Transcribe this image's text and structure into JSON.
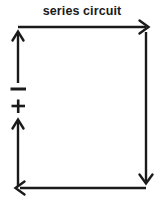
{
  "figure": {
    "kind": "circuit-schematic",
    "title": "series circuit",
    "width": 164,
    "height": 205,
    "background_color": "#ffffff",
    "stroke_color": "#1a1a1a",
    "stroke_width": 2.2
  },
  "labels": {
    "battery_negative": "−",
    "battery_positive": "+"
  },
  "elements": [
    {
      "name": "top-wire",
      "type": "arrow",
      "direction": "right",
      "from": [
        18,
        27
      ],
      "to": [
        147,
        27
      ]
    },
    {
      "name": "right-wire",
      "type": "arrow",
      "direction": "down",
      "from": [
        146,
        30
      ],
      "to": [
        146,
        186
      ]
    },
    {
      "name": "bottom-wire",
      "type": "arrow",
      "direction": "left",
      "from": [
        146,
        188
      ],
      "to": [
        18,
        188
      ]
    },
    {
      "name": "upper-left-wire",
      "type": "arrow",
      "direction": "up",
      "from": [
        18,
        83
      ],
      "to": [
        18,
        30
      ]
    },
    {
      "name": "lower-left-wire",
      "type": "arrow",
      "direction": "up",
      "from": [
        18,
        187
      ],
      "to": [
        18,
        118
      ]
    },
    {
      "name": "battery-negative-plate",
      "type": "bar",
      "x1": 11,
      "x2": 26,
      "y": 89
    },
    {
      "name": "battery-positive-sign",
      "type": "plus",
      "cx": 18,
      "cy": 106,
      "size": 14
    }
  ]
}
